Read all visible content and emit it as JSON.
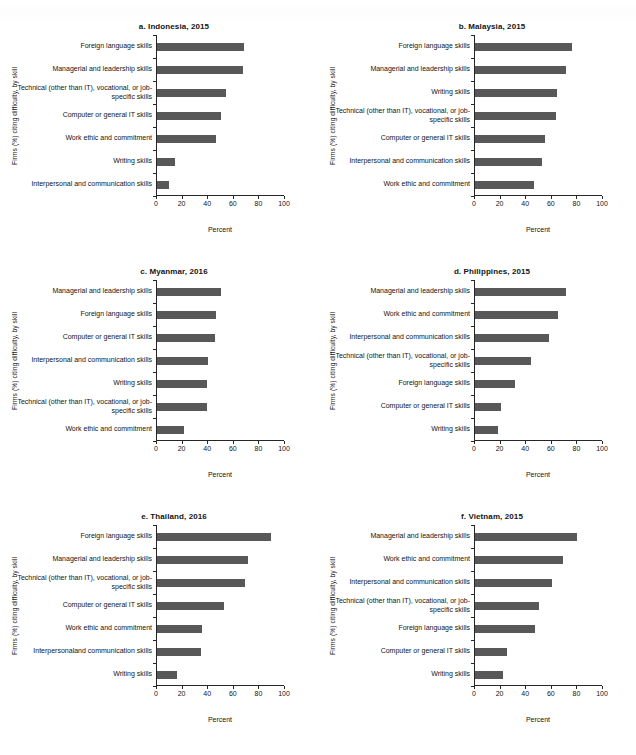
{
  "figure": {
    "axis_label_y": "Firms (%) citing difficulty, by skill",
    "axis_label_x": "Percent",
    "bar_color": "#585858",
    "axis_color": "#262626",
    "xticks": [
      0,
      20,
      40,
      60,
      80,
      100
    ],
    "xtick_labels": [
      "0",
      "20",
      "40",
      "60",
      "80",
      "100"
    ]
  },
  "chart_data": [
    {
      "type": "bar",
      "orientation": "horizontal",
      "panel": "a",
      "title": "a. Indonesia, 2015",
      "xlabel": "Percent",
      "ylabel": "Firms (%) citing difficulty, by skill",
      "xlim": [
        0,
        100
      ],
      "grid": false,
      "legend": "none",
      "categories": [
        "Foreign language skills",
        "Managerial and leadership skills",
        "Technical (other than IT), vocational, or job-specific skills",
        "Computer or general IT skills",
        "Work ethic and commitment",
        "Writing skills",
        "Interpersonal and communication skills"
      ],
      "values": [
        68,
        67,
        54,
        50,
        46,
        14,
        9
      ]
    },
    {
      "type": "bar",
      "orientation": "horizontal",
      "panel": "b",
      "title": "b. Malaysia, 2015",
      "xlabel": "Percent",
      "ylabel": "Firms (%) citing difficulty, by skill",
      "xlim": [
        0,
        100
      ],
      "grid": false,
      "legend": "none",
      "categories": [
        "Foreign language skills",
        "Managerial and leadership skills",
        "Writing skills",
        "Technical (other than IT), vocational, or job-specific skills",
        "Computer or general IT skills",
        "Interpersonal and communication skills",
        "Work ethic and commitment"
      ],
      "values": [
        76,
        71,
        64,
        63,
        55,
        52,
        46
      ]
    },
    {
      "type": "bar",
      "orientation": "horizontal",
      "panel": "c",
      "title": "c. Myanmar, 2016",
      "xlabel": "Percent",
      "ylabel": "Firms (%) citing difficulty, by skill",
      "xlim": [
        0,
        100
      ],
      "grid": false,
      "legend": "none",
      "categories": [
        "Managerial and leadership skills",
        "Foreign language skills",
        "Computer or general IT skills",
        "Interpersonal and communication skills",
        "Writing skills",
        "Technical (other than IT), vocational, or job-specific skills",
        "Work ethic and commitment"
      ],
      "values": [
        50,
        46,
        45,
        40,
        39,
        39,
        21
      ]
    },
    {
      "type": "bar",
      "orientation": "horizontal",
      "panel": "d",
      "title": "d. Philippines, 2015",
      "xlabel": "Percent",
      "ylabel": "Firms (%) citing difficulty, by skill",
      "xlim": [
        0,
        100
      ],
      "grid": false,
      "legend": "none",
      "categories": [
        "Managerial and leadership skills",
        "Work ethic and commitment",
        "Interpersonal and communication skills",
        "Technical (other than IT), vocational, or job-specific skills",
        "Foreign language skills",
        "Computer or general IT skills",
        "Writing skills"
      ],
      "values": [
        71,
        65,
        58,
        44,
        31,
        20,
        18
      ]
    },
    {
      "type": "bar",
      "orientation": "horizontal",
      "panel": "e",
      "title": "e. Thailand, 2016",
      "xlabel": "Percent",
      "ylabel": "Firms (%) citing difficulty, by skill",
      "xlim": [
        0,
        100
      ],
      "grid": false,
      "legend": "none",
      "categories": [
        "Foreign language skills",
        "Managerial and leadership skills",
        "Technical (other than IT), vocational, or job-specific skills",
        "Computer or general IT skills",
        "Work ethic and commitment",
        "Interpersonaland communication skills",
        "Writing skills"
      ],
      "values": [
        89,
        71,
        69,
        52,
        35,
        34,
        16
      ]
    },
    {
      "type": "bar",
      "orientation": "horizontal",
      "panel": "f",
      "title": "f. Vietnam, 2015",
      "xlabel": "Percent",
      "ylabel": "Firms (%) citing difficulty, by skill",
      "xlim": [
        0,
        100
      ],
      "grid": false,
      "legend": "none",
      "categories": [
        "Managerial and leadership skills",
        "Work ethic and commitment",
        "Interpersonal and communication skills",
        "Technical (other than IT), vocational, or job-specific skills",
        "Foreign language skills",
        "Computer or general IT skills",
        "Writing skills"
      ],
      "values": [
        80,
        69,
        60,
        50,
        47,
        25,
        22
      ]
    }
  ]
}
